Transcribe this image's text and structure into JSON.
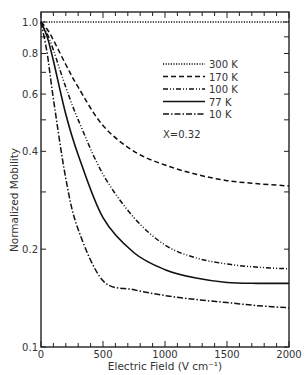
{
  "chart_data": {
    "type": "line",
    "title": "",
    "xlabel": "Electric Field (V cm⁻¹)",
    "ylabel": "Normalized Mobility",
    "xlim": [
      0,
      2000
    ],
    "ylim": [
      0.1,
      1.0
    ],
    "yscale": "log",
    "grid": false,
    "legend_position": "upper right",
    "annotation": "X=0.32",
    "x_ticks": [
      0,
      500,
      1000,
      1500,
      2000
    ],
    "x_tick_labels": [
      "0",
      "500",
      "1000",
      "1500",
      "2000"
    ],
    "y_ticks": [
      0.1,
      0.2,
      0.4,
      0.6,
      0.8,
      1.0
    ],
    "y_tick_labels": [
      "0.1",
      "0.2",
      "0.4",
      "0.6",
      "0.8",
      "1.0"
    ],
    "x": [
      0,
      50,
      100,
      200,
      300,
      500,
      750,
      1000,
      1250,
      1500,
      1750,
      2000
    ],
    "series": [
      {
        "name": "300 K",
        "style": "dotted",
        "values": [
          1.0,
          1.0,
          1.0,
          1.0,
          1.0,
          1.0,
          1.0,
          1.0,
          1.0,
          1.0,
          1.0,
          1.0
        ]
      },
      {
        "name": "170 K",
        "style": "dashed",
        "values": [
          1.0,
          0.95,
          0.88,
          0.74,
          0.63,
          0.48,
          0.4,
          0.363,
          0.34,
          0.325,
          0.318,
          0.313
        ]
      },
      {
        "name": "100 K",
        "style": "dash-dot-dot",
        "values": [
          1.0,
          0.92,
          0.82,
          0.63,
          0.5,
          0.34,
          0.25,
          0.206,
          0.188,
          0.18,
          0.176,
          0.174
        ]
      },
      {
        "name": "77 K",
        "style": "solid",
        "values": [
          1.0,
          0.9,
          0.76,
          0.52,
          0.39,
          0.25,
          0.195,
          0.173,
          0.163,
          0.158,
          0.157,
          0.157
        ]
      },
      {
        "name": "10 K",
        "style": "dash-dot",
        "values": [
          1.0,
          0.8,
          0.58,
          0.33,
          0.23,
          0.16,
          0.15,
          0.144,
          0.14,
          0.137,
          0.134,
          0.132
        ]
      }
    ]
  }
}
